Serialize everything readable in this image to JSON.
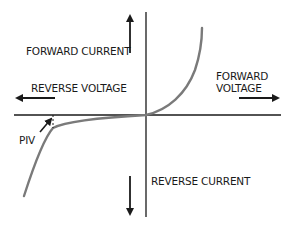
{
  "diagram": {
    "labels": {
      "forward_current": "FORWARD CURRENT",
      "reverse_voltage": "REVERSE VOLTAGE",
      "forward_voltage_line1": "FORWARD",
      "forward_voltage_line2": "VOLTAGE",
      "reverse_current": "REVERSE CURRENT",
      "piv": "PIV"
    },
    "colors": {
      "axis": "#1a1a1a",
      "curve": "#7a7a7a",
      "text": "#1a1a1a"
    }
  }
}
